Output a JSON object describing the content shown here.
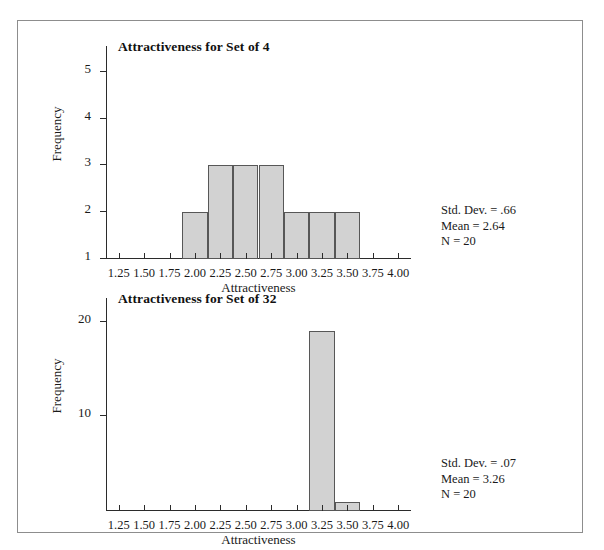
{
  "figure": {
    "panels": [
      {
        "id": "set-of-4",
        "title": "Attractiveness for Set of 4",
        "xlabel": "Attractiveness",
        "ylabel": "Frequency",
        "stats": {
          "std_dev": "Std. Dev. = .66",
          "mean": "Mean = 2.64",
          "n": "N = 20"
        }
      },
      {
        "id": "set-of-32",
        "title": "Attractiveness for Set of 32",
        "xlabel": "Attractiveness",
        "ylabel": "Frequency",
        "stats": {
          "std_dev": "Std. Dev. = .07",
          "mean": "Mean = 3.26",
          "n": "N = 20"
        }
      }
    ]
  },
  "chart_data": [
    {
      "type": "bar",
      "title": "Attractiveness for Set of 4",
      "xlabel": "Attractiveness",
      "ylabel": "Frequency",
      "categories": [
        1.25,
        1.5,
        1.75,
        2.0,
        2.25,
        2.5,
        2.75,
        3.0,
        3.25,
        3.5,
        3.75,
        4.0
      ],
      "xtick_labels": [
        "1.25",
        "1.50",
        "1.75",
        "2.00",
        "2.25",
        "2.50",
        "2.75",
        "3.00",
        "3.25",
        "3.50",
        "3.75",
        "4.00"
      ],
      "values": [
        0,
        0,
        0,
        2,
        3,
        3,
        3,
        2,
        2,
        2,
        0,
        0
      ],
      "ytick_values": [
        1,
        2,
        3,
        4,
        5
      ],
      "ytick_labels": [
        "1",
        "2",
        "3",
        "4",
        "5"
      ],
      "xlim": [
        1.125,
        4.125
      ],
      "ylim": [
        1,
        5.55
      ],
      "grid": false,
      "legend": false,
      "bar_fill": "#d2d2d2",
      "bar_edge": "#575757",
      "annotations": [
        "Std. Dev. = .66",
        "Mean = 2.64",
        "N = 20"
      ]
    },
    {
      "type": "bar",
      "title": "Attractiveness for Set of 32",
      "xlabel": "Attractiveness",
      "ylabel": "Frequency",
      "categories": [
        1.25,
        1.5,
        1.75,
        2.0,
        2.25,
        2.5,
        2.75,
        3.0,
        3.25,
        3.5,
        3.75,
        4.0
      ],
      "xtick_labels": [
        "1.25",
        "1.50",
        "1.75",
        "2.00",
        "2.25",
        "2.50",
        "2.75",
        "3.00",
        "3.25",
        "3.50",
        "3.75",
        "4.00"
      ],
      "values": [
        0,
        0,
        0,
        0,
        0,
        0,
        0,
        0,
        19,
        1,
        0,
        0
      ],
      "ytick_values": [
        10,
        20
      ],
      "ytick_labels": [
        "10",
        "20"
      ],
      "xlim": [
        1.125,
        4.125
      ],
      "ylim": [
        0,
        22.5
      ],
      "grid": false,
      "legend": false,
      "bar_fill": "#d2d2d2",
      "bar_edge": "#575757",
      "annotations": [
        "Std. Dev. = .07",
        "Mean = 3.26",
        "N = 20"
      ]
    }
  ]
}
